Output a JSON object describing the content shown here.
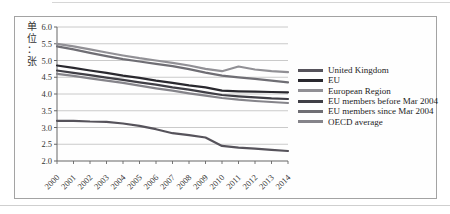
{
  "figure": {
    "y_axis_unit_label": "单\n位\n：\n张"
  },
  "chart_data": {
    "type": "line",
    "title": "",
    "xlabel": "",
    "ylabel": "单位：张",
    "x": [
      2000,
      2001,
      2002,
      2003,
      2004,
      2005,
      2006,
      2007,
      2008,
      2009,
      2010,
      2011,
      2012,
      2013,
      2014
    ],
    "ylim": [
      2.0,
      6.0
    ],
    "ytick_step": 0.5,
    "grid": true,
    "legend_position": "right",
    "series": [
      {
        "name": "United Kingdom",
        "color": "#56535b",
        "values": [
          3.2,
          3.2,
          3.18,
          3.17,
          3.12,
          3.05,
          2.95,
          2.83,
          2.77,
          2.7,
          2.45,
          2.4,
          2.37,
          2.33,
          2.3
        ]
      },
      {
        "name": "EU",
        "color": "#29282e",
        "values": [
          4.85,
          4.78,
          4.7,
          4.63,
          4.55,
          4.48,
          4.4,
          4.33,
          4.26,
          4.2,
          4.1,
          4.08,
          4.07,
          4.06,
          4.05
        ]
      },
      {
        "name": "European Region",
        "color": "#919095",
        "values": [
          5.5,
          5.42,
          5.33,
          5.24,
          5.15,
          5.07,
          5.0,
          4.93,
          4.85,
          4.75,
          4.68,
          4.82,
          4.73,
          4.68,
          4.65
        ]
      },
      {
        "name": "EU members before Mar 2004",
        "color": "#403f46",
        "values": [
          4.7,
          4.63,
          4.56,
          4.49,
          4.42,
          4.35,
          4.28,
          4.2,
          4.13,
          4.05,
          3.97,
          3.93,
          3.9,
          3.87,
          3.85
        ]
      },
      {
        "name": "EU members since Mar 2004",
        "color": "#6f6e74",
        "values": [
          5.42,
          5.33,
          5.23,
          5.13,
          5.04,
          4.97,
          4.9,
          4.83,
          4.74,
          4.64,
          4.55,
          4.5,
          4.45,
          4.4,
          4.35
        ]
      },
      {
        "name": "OECD average",
        "color": "#85848a",
        "values": [
          4.6,
          4.54,
          4.47,
          4.4,
          4.33,
          4.25,
          4.17,
          4.1,
          4.02,
          3.95,
          3.88,
          3.83,
          3.79,
          3.76,
          3.73
        ]
      }
    ]
  }
}
